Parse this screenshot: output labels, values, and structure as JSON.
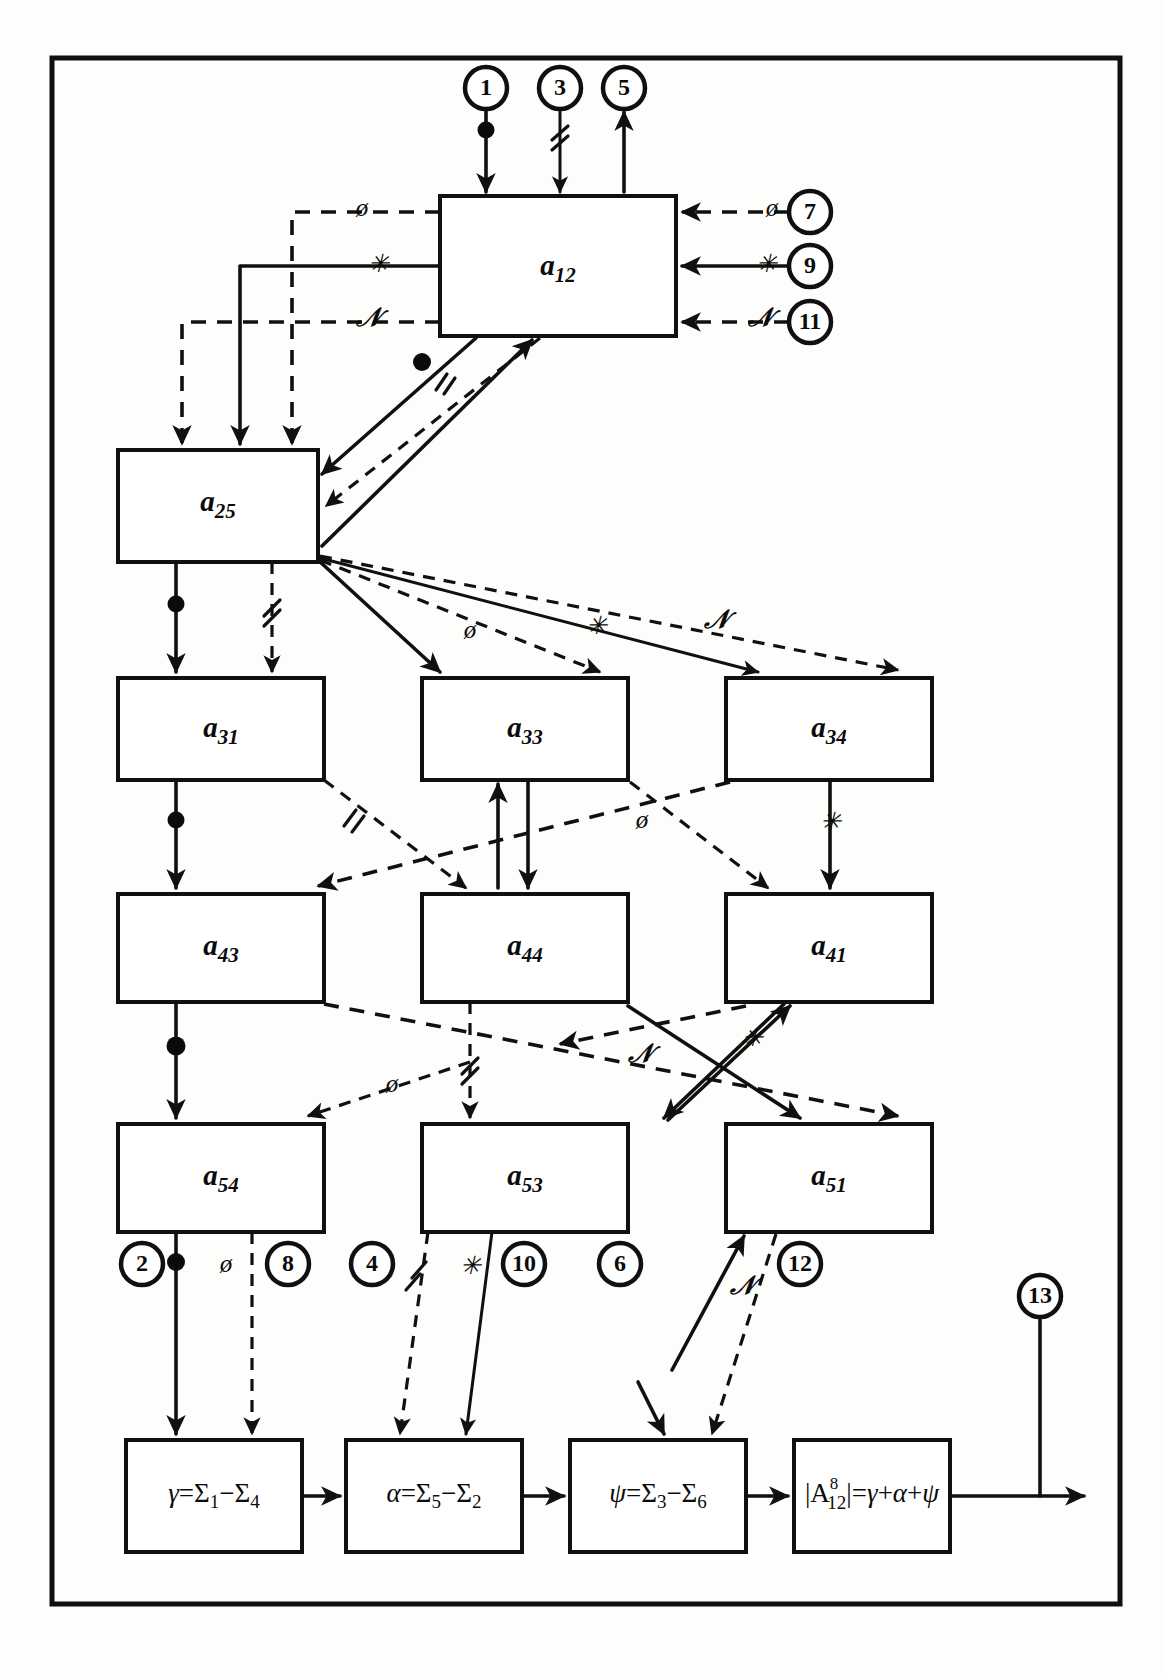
{
  "diagram": {
    "frame": {
      "present": true
    },
    "blocks": [
      {
        "id": "a12",
        "base": "a",
        "sub": "12",
        "x": 440,
        "y": 196,
        "w": 236,
        "h": 140
      },
      {
        "id": "a25",
        "base": "a",
        "sub": "25",
        "x": 118,
        "y": 450,
        "w": 200,
        "h": 112
      },
      {
        "id": "a31",
        "base": "a",
        "sub": "31",
        "x": 118,
        "y": 678,
        "w": 206,
        "h": 102
      },
      {
        "id": "a33",
        "base": "a",
        "sub": "33",
        "x": 422,
        "y": 678,
        "w": 206,
        "h": 102
      },
      {
        "id": "a34",
        "base": "a",
        "sub": "34",
        "x": 726,
        "y": 678,
        "w": 206,
        "h": 102
      },
      {
        "id": "a43",
        "base": "a",
        "sub": "43",
        "x": 118,
        "y": 894,
        "w": 206,
        "h": 108
      },
      {
        "id": "a44",
        "base": "a",
        "sub": "44",
        "x": 422,
        "y": 894,
        "w": 206,
        "h": 108
      },
      {
        "id": "a41",
        "base": "a",
        "sub": "41",
        "x": 726,
        "y": 894,
        "w": 206,
        "h": 108
      },
      {
        "id": "a54",
        "base": "a",
        "sub": "54",
        "x": 118,
        "y": 1124,
        "w": 206,
        "h": 108
      },
      {
        "id": "a53",
        "base": "a",
        "sub": "53",
        "x": 422,
        "y": 1124,
        "w": 206,
        "h": 108
      },
      {
        "id": "a51",
        "base": "a",
        "sub": "51",
        "x": 726,
        "y": 1124,
        "w": 206,
        "h": 108
      }
    ],
    "formula_blocks": [
      {
        "id": "gamma",
        "x": 126,
        "y": 1440,
        "w": 176,
        "h": 112,
        "parts": [
          {
            "t": "γ=Σ",
            "s": null
          },
          {
            "t": "1",
            "s": "sub"
          },
          {
            "t": "−Σ",
            "s": null
          },
          {
            "t": "4",
            "s": "sub"
          }
        ],
        "text": "γ=Σ₁−Σ₄"
      },
      {
        "id": "alpha",
        "x": 346,
        "y": 1440,
        "w": 176,
        "h": 112,
        "parts": [
          {
            "t": "α=Σ",
            "s": null
          },
          {
            "t": "5",
            "s": "sub"
          },
          {
            "t": "−Σ",
            "s": null
          },
          {
            "t": "2",
            "s": "sub"
          }
        ],
        "text": "α=Σ₅−Σ₂"
      },
      {
        "id": "psi",
        "x": 570,
        "y": 1440,
        "w": 176,
        "h": 112,
        "parts": [
          {
            "t": "ψ=Σ",
            "s": null
          },
          {
            "t": "3",
            "s": "sub"
          },
          {
            "t": "−Σ",
            "s": null
          },
          {
            "t": "6",
            "s": "sub"
          }
        ],
        "text": "ψ=Σ₃−Σ₆"
      },
      {
        "id": "result",
        "x": 794,
        "y": 1440,
        "w": 156,
        "h": 112,
        "parts": [
          {
            "t": "|A",
            "s": null
          },
          {
            "t": "8",
            "s": "sup"
          },
          {
            "t": "12",
            "s": "sub"
          },
          {
            "t": "|=γ+α+ψ",
            "s": null
          }
        ],
        "text": "|A¹²⁸|=γ+α+ψ"
      }
    ],
    "numbered_nodes": [
      {
        "n": "1",
        "cx": 486,
        "cy": 88,
        "r": 21
      },
      {
        "n": "3",
        "cx": 560,
        "cy": 88,
        "r": 21
      },
      {
        "n": "5",
        "cx": 624,
        "cy": 88,
        "r": 21
      },
      {
        "n": "7",
        "cx": 810,
        "cy": 212,
        "r": 21
      },
      {
        "n": "9",
        "cx": 810,
        "cy": 266,
        "r": 21
      },
      {
        "n": "11",
        "cx": 810,
        "cy": 322,
        "r": 21
      },
      {
        "n": "2",
        "cx": 142,
        "cy": 1264,
        "r": 21
      },
      {
        "n": "8",
        "cx": 288,
        "cy": 1264,
        "r": 21
      },
      {
        "n": "4",
        "cx": 372,
        "cy": 1264,
        "r": 21
      },
      {
        "n": "10",
        "cx": 506,
        "cy": 1264,
        "r": 21
      },
      {
        "n": "6",
        "cx": 620,
        "cy": 1264,
        "r": 21
      },
      {
        "n": "12",
        "cx": 768,
        "cy": 1264,
        "r": 21
      },
      {
        "n": "13",
        "cx": 1040,
        "cy": 1296,
        "r": 21
      }
    ],
    "edge_markers": [
      {
        "sym": "ø",
        "x": 362,
        "y": 212
      },
      {
        "sym": "✳",
        "x": 378,
        "y": 266
      },
      {
        "sym": "ℕ",
        "x": 368,
        "y": 322
      },
      {
        "sym": "ø",
        "x": 772,
        "y": 212
      },
      {
        "sym": "✳",
        "x": 766,
        "y": 266
      },
      {
        "sym": "ℕ",
        "x": 762,
        "y": 322
      },
      {
        "sym": "∥",
        "x": 440,
        "y": 384
      },
      {
        "sym": "ø",
        "x": 470,
        "y": 632
      },
      {
        "sym": "✳",
        "x": 594,
        "y": 628
      },
      {
        "sym": "ℕ",
        "x": 718,
        "y": 622
      },
      {
        "sym": "∥",
        "x": 352,
        "y": 822
      },
      {
        "sym": "ø",
        "x": 640,
        "y": 822
      },
      {
        "sym": "✳",
        "x": 738,
        "y": 824
      },
      {
        "sym": "ø",
        "x": 392,
        "y": 1088
      },
      {
        "sym": "∥",
        "x": 448,
        "y": 1072
      },
      {
        "sym": "ℕ",
        "x": 640,
        "y": 1056
      },
      {
        "sym": "✳",
        "x": 748,
        "y": 1044
      },
      {
        "sym": "ø",
        "x": 226,
        "y": 1268
      },
      {
        "sym": "∥",
        "x": 404,
        "y": 1268
      },
      {
        "sym": "✳",
        "x": 468,
        "y": 1268
      },
      {
        "sym": "ℕ",
        "x": 724,
        "y": 1282
      }
    ],
    "legend_symbols": {
      "phi": "ø",
      "star": "✳",
      "script_n": "ℕ",
      "parallel": "∥",
      "junction_dot": "•"
    }
  }
}
